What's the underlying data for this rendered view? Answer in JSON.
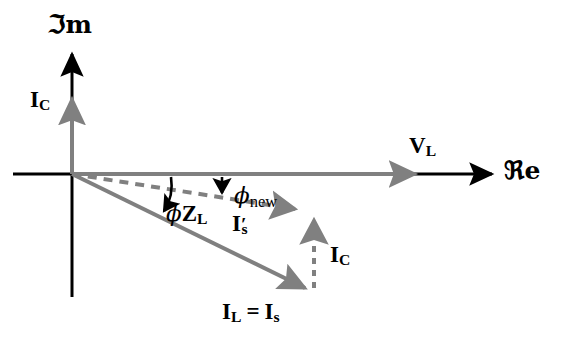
{
  "figure": {
    "type": "phasor-diagram",
    "title": "",
    "background_color": "#ffffff",
    "axis_color": "#000000",
    "phasor_color": "#808080",
    "dashed_color": "#808080"
  },
  "axes": {
    "real": {
      "name": "real-axis",
      "label": "ℜe",
      "label_text": "Re",
      "direction": "right"
    },
    "imag": {
      "name": "imaginary-axis",
      "label": "ℑm",
      "label_text": "Im",
      "direction": "up"
    }
  },
  "phasors": [
    {
      "id": "v-l",
      "label_main": "V",
      "label_sub": "L",
      "style": "solid",
      "color": "#808080",
      "description": "Load voltage phasor along positive real axis (reference)"
    },
    {
      "id": "i-c-axis",
      "label_main": "I",
      "label_sub": "C",
      "style": "solid",
      "color": "#808080",
      "description": "Capacitor current phasor along positive imaginary axis"
    },
    {
      "id": "i-l-is",
      "label_main": "I",
      "label_sub": "L",
      "label_eq": "=",
      "label_main2": "I",
      "label_sub2": "s",
      "style": "solid",
      "color": "#808080",
      "description": "Load current equals source current before compensation, lagging"
    },
    {
      "id": "i-s-prime",
      "label_main": "I",
      "label_prime": "′",
      "label_sub": "s",
      "style": "dashed",
      "color": "#808080",
      "description": "New source current after capacitor compensation"
    },
    {
      "id": "i-c-vertical",
      "label_main": "I",
      "label_sub": "C",
      "style": "dashed",
      "color": "#808080",
      "description": "Capacitor current added vertically at tip of I_L"
    }
  ],
  "angles": [
    {
      "id": "phi-z-l",
      "symbol": "ϕ",
      "sub_main": "Z",
      "sub_sub": "L",
      "description": "Original load impedance angle between Re axis and I_L"
    },
    {
      "id": "phi-new",
      "symbol": "ϕ",
      "sub": "new",
      "description": "Improved power factor angle between Re axis and I′_s"
    }
  ],
  "labels": {
    "im_axis": "ℑm",
    "re_axis": "ℜe",
    "i_c_top_main": "I",
    "i_c_top_sub": "C",
    "v_l_main": "V",
    "v_l_sub": "L",
    "phi_new_symbol": "ϕ",
    "phi_new_sub": "new",
    "phi_zl_symbol": "ϕ",
    "phi_zl_main": "Z",
    "phi_zl_sub": "L",
    "i_s_prime_main": "I",
    "i_s_prime_mark": "′",
    "i_s_prime_sub": "s",
    "i_c_mid_main": "I",
    "i_c_mid_sub": "C",
    "i_l_main": "I",
    "i_l_sub": "L",
    "i_l_eq": "=",
    "i_s_main": "I",
    "i_s_sub": "s"
  }
}
